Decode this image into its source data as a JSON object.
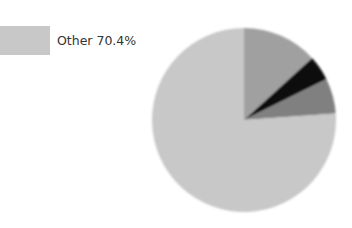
{
  "chart_data": {
    "type": "pie",
    "title": "",
    "legend_position": "top-left",
    "legend": [
      {
        "label": "Other 70.4%",
        "color": "#c8c8c8"
      }
    ],
    "slices": [
      {
        "name": "Slice A (unlabeled, est.)",
        "value": 16.5,
        "color": "#a0a0a0",
        "start_deg": 0,
        "end_deg": 47.7
      },
      {
        "name": "Slice B (unlabeled, est.)",
        "value": 5.5,
        "color": "#0a0a0a",
        "start_deg": 47.7,
        "end_deg": 63.7
      },
      {
        "name": "Slice C (unlabeled, est.)",
        "value": 7.6,
        "color": "#808080",
        "start_deg": 63.7,
        "end_deg": 86
      },
      {
        "name": "Other",
        "value": 70.4,
        "color": "#c8c8c8",
        "start_deg": 86,
        "end_deg": 360
      }
    ],
    "center": [
      244,
      120
    ],
    "radius": 92
  },
  "legend": {
    "items": [
      {
        "label": "Other 70.4%",
        "color": "#c8c8c8"
      }
    ]
  }
}
